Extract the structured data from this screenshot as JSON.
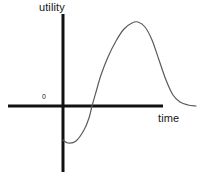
{
  "chart_data": {
    "type": "line",
    "title": "",
    "subtitle": "",
    "xlabel": "time",
    "ylabel": "utility",
    "origin_label": "0",
    "grid": false,
    "legend": null,
    "annotations": [],
    "axes": {
      "x_axis_color": "#111111",
      "y_axis_color": "#111111",
      "x_axis_width_px": 3,
      "y_axis_width_px": 3,
      "x_axis_y_px": 106,
      "y_axis_x_px": 63,
      "x_axis_from_px": 8,
      "x_axis_to_px": 163,
      "y_axis_from_px": 14,
      "y_axis_to_px": 172
    },
    "series": [
      {
        "name": "utility",
        "color": "#5a5a5a",
        "width_px": 1.2,
        "description": "Starts below zero on the vertical axis, dips to a minimum, rises steeply through zero, peaks high, then falls and flattens just above zero.",
        "points_px": [
          [
            63,
            140
          ],
          [
            68,
            143
          ],
          [
            76,
            141
          ],
          [
            84,
            130
          ],
          [
            89,
            118
          ],
          [
            92,
            106
          ],
          [
            96,
            92
          ],
          [
            101,
            75
          ],
          [
            108,
            57
          ],
          [
            116,
            41
          ],
          [
            124,
            29
          ],
          [
            132,
            23
          ],
          [
            138,
            22
          ],
          [
            145,
            27
          ],
          [
            152,
            40
          ],
          [
            159,
            60
          ],
          [
            166,
            80
          ],
          [
            173,
            95
          ],
          [
            180,
            102
          ],
          [
            188,
            105
          ],
          [
            196,
            106
          ]
        ],
        "features": {
          "start_value": "below zero",
          "minimum_px": [
            68,
            143
          ],
          "zero_crossing_px": [
            92,
            106
          ],
          "maximum_px": [
            138,
            22
          ],
          "end_value": "slightly above zero"
        }
      }
    ],
    "background_color": "#ffffff"
  }
}
